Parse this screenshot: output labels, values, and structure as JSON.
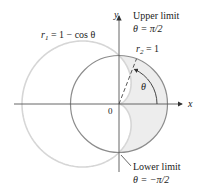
{
  "diagram": {
    "type": "polar-region",
    "axes": {
      "x_label": "x",
      "y_label": "y",
      "origin_label": "0"
    },
    "curves": [
      {
        "id": "r1",
        "equation": "r = 1 − cos θ",
        "label_main": "r",
        "label_sub": "1",
        "label_rest": " = 1 − cos θ",
        "color": "#d4d4d4"
      },
      {
        "id": "r2",
        "equation": "r = 1",
        "label_main": "r",
        "label_sub": "2",
        "label_rest": " = 1",
        "color": "#8a8a8a"
      }
    ],
    "shaded_region": {
      "description": "inside r2 = 1 and outside r1 = 1 − cos θ, right half",
      "color": "#eeeeee"
    },
    "angle_label": "θ",
    "upper_limit": {
      "title": "Upper limit",
      "value": "θ = π/2"
    },
    "lower_limit": {
      "title": "Lower limit",
      "value": "θ = −π/2"
    }
  }
}
